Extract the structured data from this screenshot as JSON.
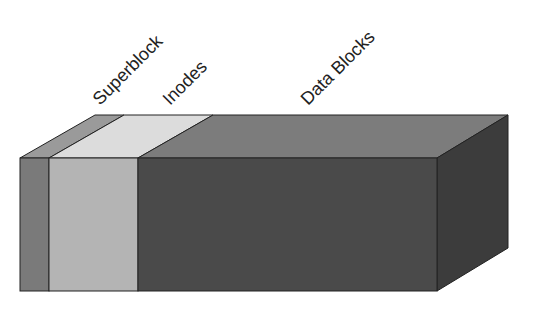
{
  "diagram": {
    "labels": {
      "superblock": "Superblock",
      "inodes": "Inodes",
      "data_blocks": "Data Blocks"
    },
    "colors": {
      "superblock_front": "#7a7a7a",
      "superblock_top": "#9a9a9a",
      "inodes_front": "#b4b4b4",
      "inodes_top": "#dcdcdc",
      "data_front": "#4a4a4a",
      "data_top": "#7c7c7c",
      "data_side": "#3c3c3c",
      "outline": "#222222"
    }
  }
}
